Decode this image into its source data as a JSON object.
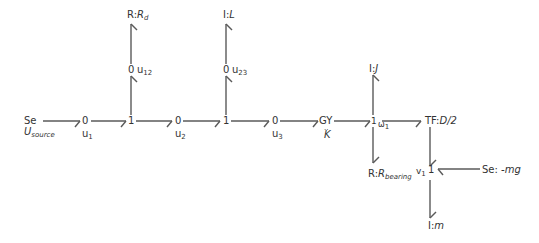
{
  "diagram": {
    "type": "bond-graph",
    "elements": {
      "source": {
        "kind": "Se",
        "param": "U",
        "param_sub": "source"
      },
      "r_d": {
        "kind": "R",
        "sep": ":",
        "param": "R",
        "param_sub": "d"
      },
      "i_l": {
        "kind": "I",
        "sep": ":",
        "param": "L"
      },
      "i_j": {
        "kind": "I",
        "sep": ":",
        "param": "J"
      },
      "r_bearing": {
        "kind": "R",
        "sep": ":",
        "param": "R",
        "param_sub": "bearing"
      },
      "tf": {
        "kind": "TF",
        "sep": ":",
        "param": "D/2"
      },
      "se_mg": {
        "kind": "Se",
        "sep": ": ",
        "param": "-mg"
      },
      "i_m": {
        "kind": "I",
        "sep": ":",
        "param": "m"
      },
      "gy": {
        "kind": "GY",
        "dots": "..",
        "param": "K"
      }
    },
    "junctions": {
      "j0_u1": {
        "type": "0",
        "var": "u",
        "var_sub": "1"
      },
      "j1_a": {
        "type": "1"
      },
      "j0_u12": {
        "type": "0",
        "var": "u",
        "var_sub": "12"
      },
      "j0_u2": {
        "type": "0",
        "var": "u",
        "var_sub": "2"
      },
      "j1_b": {
        "type": "1"
      },
      "j0_u23": {
        "type": "0",
        "var": "u",
        "var_sub": "23"
      },
      "j0_u3": {
        "type": "0",
        "var": "u",
        "var_sub": "3"
      },
      "j1_w1": {
        "type": "1",
        "var": "ω",
        "var_sub": "1"
      },
      "j1_v1": {
        "type": "1",
        "var": "v",
        "var_sub": "1"
      }
    },
    "colors": {
      "line": "#5a5a5a",
      "text": "#333333",
      "background": "#ffffff"
    }
  }
}
